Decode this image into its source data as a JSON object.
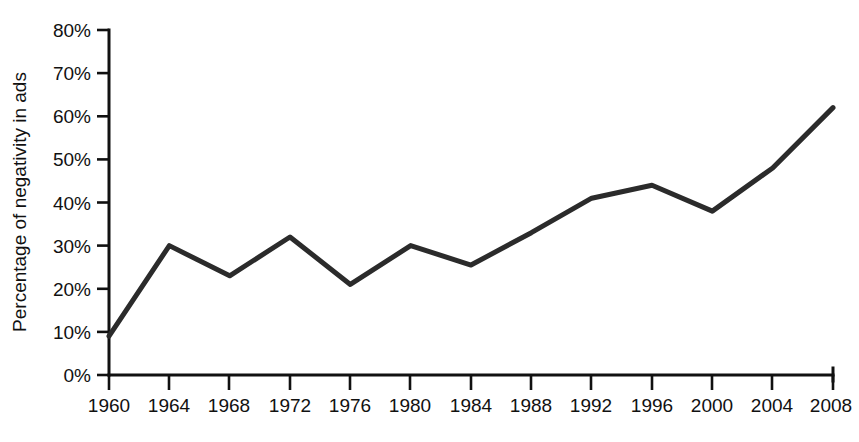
{
  "chart_data": {
    "type": "line",
    "title": "",
    "xlabel": "",
    "ylabel": "Percentage of negativity in ads",
    "x": [
      1960,
      1964,
      1968,
      1972,
      1976,
      1980,
      1984,
      1988,
      1992,
      1996,
      2000,
      2004,
      2008
    ],
    "categories": [
      "1960",
      "1964",
      "1968",
      "1972",
      "1976",
      "1980",
      "1984",
      "1988",
      "1992",
      "1996",
      "2000",
      "2004",
      "2008"
    ],
    "values": [
      9,
      30,
      23,
      32,
      21,
      30,
      25.5,
      33,
      41,
      44,
      38,
      48,
      62
    ],
    "series": [
      {
        "name": "Percentage of negativity in ads",
        "values": [
          9,
          30,
          23,
          32,
          21,
          30,
          25.5,
          33,
          41,
          44,
          38,
          48,
          62
        ]
      }
    ],
    "ylim": [
      0,
      80
    ],
    "xlim": [
      1960,
      2008
    ],
    "ytick_values": [
      0,
      10,
      20,
      30,
      40,
      50,
      60,
      70,
      80
    ],
    "ytick_labels": [
      "0%",
      "10%",
      "20%",
      "30%",
      "40%",
      "50%",
      "60%",
      "70%",
      "80%"
    ],
    "xtick_labels": [
      "1960",
      "1964",
      "1968",
      "1972",
      "1976",
      "1980",
      "1984",
      "1988",
      "1992",
      "1996",
      "2000",
      "2004",
      "2008"
    ],
    "grid": false,
    "legend": false,
    "legend_position": "none",
    "annotations": [],
    "line_color": "#2b2b2b",
    "axis_color": "#111111",
    "background_color": "#ffffff"
  },
  "axes": {
    "y_title": "Percentage of negativity in ads",
    "y_labels": [
      "80%",
      "70%",
      "60%",
      "50%",
      "40%",
      "30%",
      "20%",
      "10%",
      "0%"
    ],
    "x_labels": [
      "1960",
      "1964",
      "1968",
      "1972",
      "1976",
      "1980",
      "1984",
      "1988",
      "1992",
      "1996",
      "2000",
      "2004",
      "2008"
    ]
  }
}
